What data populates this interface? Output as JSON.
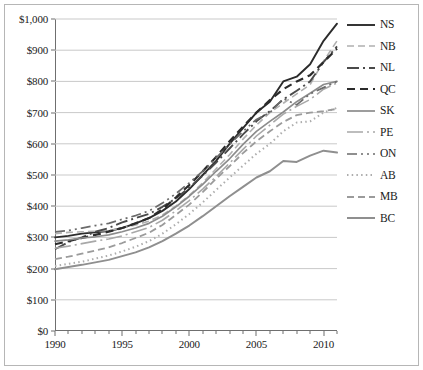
{
  "chart_data": {
    "type": "line",
    "title": "",
    "xlabel": "",
    "ylabel": "",
    "grid": "horizontal",
    "legend_position": "right",
    "xlim": [
      1990,
      2011
    ],
    "ylim": [
      0,
      1000
    ],
    "y_ticks": [
      0,
      100,
      200,
      300,
      400,
      500,
      600,
      700,
      800,
      900,
      1000
    ],
    "y_tick_labels": [
      "$0",
      "$100",
      "$200",
      "$300",
      "$400",
      "$500",
      "$600",
      "$700",
      "$800",
      "$900",
      "$1,000"
    ],
    "x_ticks": [
      1990,
      1995,
      2000,
      2005,
      2010
    ],
    "x_tick_labels": [
      "1990",
      "1995",
      "2000",
      "2005",
      "2010"
    ],
    "x_minor_ticks": [
      1991,
      1992,
      1993,
      1994,
      1996,
      1997,
      1998,
      1999,
      2001,
      2002,
      2003,
      2004,
      2006,
      2007,
      2008,
      2009,
      2011
    ],
    "x": [
      1990,
      1991,
      1992,
      1993,
      1994,
      1995,
      1996,
      1997,
      1998,
      1999,
      2000,
      2001,
      2002,
      2003,
      2004,
      2005,
      2006,
      2007,
      2008,
      2009,
      2010,
      2011
    ],
    "series": [
      {
        "name": "NS",
        "color": "#2b2b2b",
        "width": 1.9,
        "dash": "none",
        "values": [
          300,
          305,
          312,
          316,
          320,
          330,
          345,
          362,
          385,
          415,
          455,
          500,
          545,
          600,
          650,
          700,
          735,
          800,
          815,
          855,
          930,
          985
        ]
      },
      {
        "name": "NB",
        "color": "#b0b0b0",
        "width": 1.6,
        "dash": "7,4",
        "values": [
          312,
          316,
          318,
          320,
          322,
          330,
          340,
          352,
          372,
          400,
          435,
          475,
          520,
          565,
          615,
          660,
          700,
          730,
          760,
          790,
          865,
          930
        ]
      },
      {
        "name": "NL",
        "color": "#4a4a4a",
        "width": 1.9,
        "dash": "12,4,2,4",
        "values": [
          262,
          285,
          300,
          318,
          330,
          348,
          362,
          375,
          398,
          425,
          460,
          498,
          540,
          585,
          630,
          672,
          705,
          742,
          770,
          800,
          862,
          912
        ]
      },
      {
        "name": "QC",
        "color": "#2b2b2b",
        "width": 2.2,
        "dash": "8,5",
        "values": [
          278,
          288,
          298,
          308,
          318,
          330,
          345,
          362,
          390,
          428,
          468,
          512,
          558,
          608,
          655,
          700,
          740,
          775,
          800,
          820,
          862,
          905
        ]
      },
      {
        "name": "SK",
        "color": "#8c8c8c",
        "width": 1.7,
        "dash": "none",
        "values": [
          288,
          292,
          298,
          302,
          308,
          318,
          330,
          345,
          368,
          398,
          432,
          470,
          512,
          552,
          598,
          640,
          672,
          702,
          735,
          762,
          790,
          800
        ]
      },
      {
        "name": "PE",
        "color": "#a8a8a8",
        "width": 1.6,
        "dash": "16,4,2,4",
        "values": [
          265,
          272,
          280,
          288,
          295,
          305,
          318,
          332,
          355,
          385,
          418,
          455,
          495,
          538,
          582,
          625,
          660,
          695,
          720,
          742,
          775,
          795
        ]
      },
      {
        "name": "ON",
        "color": "#6b6b6b",
        "width": 1.7,
        "dash": "10,4,2,4,2,4",
        "values": [
          318,
          322,
          330,
          338,
          345,
          358,
          370,
          385,
          410,
          440,
          475,
          512,
          555,
          598,
          640,
          678,
          700,
          745,
          725,
          760,
          780,
          800
        ]
      },
      {
        "name": "AB",
        "color": "#adadad",
        "width": 2.0,
        "dash": "1.5,3.2",
        "values": [
          208,
          215,
          222,
          232,
          242,
          255,
          270,
          288,
          312,
          342,
          375,
          412,
          452,
          492,
          530,
          568,
          600,
          640,
          668,
          672,
          700,
          715
        ]
      },
      {
        "name": "MB",
        "color": "#9b9b9b",
        "width": 1.8,
        "dash": "7,4",
        "values": [
          230,
          238,
          248,
          258,
          268,
          282,
          298,
          315,
          340,
          372,
          405,
          445,
          488,
          528,
          570,
          608,
          640,
          670,
          692,
          700,
          705,
          712
        ]
      },
      {
        "name": "BC",
        "color": "#8f8f8f",
        "width": 2.0,
        "dash": "none",
        "values": [
          198,
          205,
          212,
          220,
          228,
          240,
          252,
          268,
          288,
          312,
          338,
          368,
          400,
          432,
          462,
          492,
          512,
          545,
          542,
          562,
          578,
          572
        ]
      }
    ]
  },
  "legend": {
    "items": [
      {
        "label": "NS"
      },
      {
        "label": "NB"
      },
      {
        "label": "NL"
      },
      {
        "label": "QC"
      },
      {
        "label": "SK"
      },
      {
        "label": "PE"
      },
      {
        "label": "ON"
      },
      {
        "label": "AB"
      },
      {
        "label": "MB"
      },
      {
        "label": "BC"
      }
    ]
  }
}
